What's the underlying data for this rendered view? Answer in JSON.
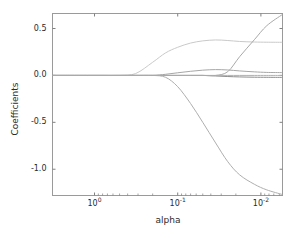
{
  "figure": {
    "background_color": "#ffffff",
    "frame_color": "#9a9a9a",
    "tick_color": "#808080",
    "text_color": "#2b2b2b"
  },
  "chart_data": {
    "type": "line",
    "title": "",
    "xlabel": "alpha",
    "ylabel": "Coefficients",
    "xscale": "log",
    "x_inverted": true,
    "xlim": [
      3.2,
      0.0055
    ],
    "ylim": [
      -1.28,
      0.66
    ],
    "grid": false,
    "legend": false,
    "xticks": [
      {
        "value": 1,
        "label": "10",
        "exponent": "0"
      },
      {
        "value": 0.1,
        "label": "10",
        "exponent": "-1"
      },
      {
        "value": 0.01,
        "label": "10",
        "exponent": "-2"
      }
    ],
    "yticks": [
      {
        "value": 0.5,
        "label": "0.5"
      },
      {
        "value": 0.0,
        "label": "0.0"
      },
      {
        "value": -0.5,
        "label": "-0.5"
      },
      {
        "value": -1.0,
        "label": "-1.0"
      }
    ],
    "x": [
      3.2,
      2.0,
      1.2,
      0.8,
      0.5,
      0.32,
      0.2,
      0.14,
      0.1,
      0.07,
      0.05,
      0.035,
      0.025,
      0.018,
      0.012,
      0.0085,
      0.0055
    ],
    "series": [
      {
        "name": "coef-1",
        "color": "#c9c9c9",
        "values": [
          0.0,
          0.0,
          0.0,
          0.0,
          0.0,
          0.02,
          0.14,
          0.24,
          0.3,
          0.345,
          0.368,
          0.378,
          0.372,
          0.362,
          0.356,
          0.354,
          0.353
        ]
      },
      {
        "name": "coef-2",
        "color": "#a6a6a6",
        "values": [
          0.0,
          0.0,
          0.0,
          0.0,
          0.0,
          0.0,
          0.0,
          0.012,
          0.028,
          0.044,
          0.056,
          0.062,
          0.058,
          0.048,
          0.038,
          0.032,
          0.03
        ]
      },
      {
        "name": "coef-3",
        "color": "#8c8c8c",
        "values": [
          0.0,
          0.0,
          0.0,
          0.0,
          0.0,
          0.0,
          0.0,
          0.0,
          0.0,
          0.0,
          0.0,
          -0.006,
          -0.012,
          -0.016,
          -0.019,
          -0.02,
          -0.021
        ]
      },
      {
        "name": "coef-4",
        "color": "#b0b0b0",
        "values": [
          0.0,
          0.0,
          0.0,
          0.0,
          0.0,
          0.0,
          0.0,
          0.0,
          0.0,
          0.0,
          0.0,
          0.0,
          0.0,
          0.0,
          0.0,
          0.0,
          0.0
        ]
      },
      {
        "name": "coef-5-negative",
        "color": "#aeaeae",
        "values": [
          0.0,
          0.0,
          0.0,
          0.0,
          0.0,
          0.0,
          0.0,
          -0.02,
          -0.12,
          -0.3,
          -0.5,
          -0.72,
          -0.92,
          -1.06,
          -1.16,
          -1.22,
          -1.27
        ]
      },
      {
        "name": "coef-6-positive",
        "color": "#a9a9a9",
        "values": [
          0.0,
          0.0,
          0.0,
          0.0,
          0.0,
          0.0,
          0.0,
          0.0,
          0.0,
          0.0,
          0.0,
          0.0,
          0.04,
          0.2,
          0.38,
          0.53,
          0.65
        ]
      }
    ]
  }
}
